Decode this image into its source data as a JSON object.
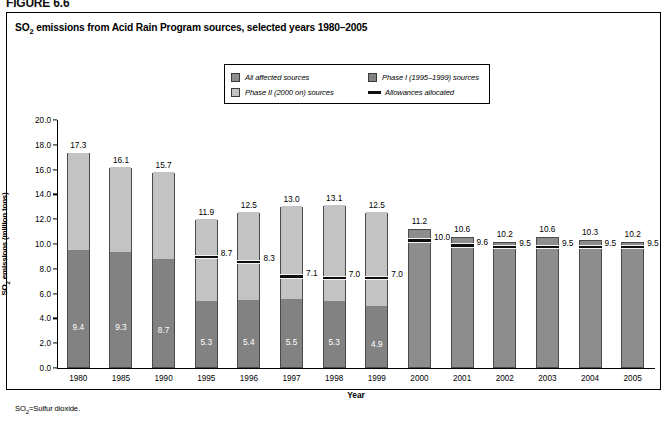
{
  "figure": {
    "label": "FIGURE 6.6"
  },
  "chart_title_prefix": "SO",
  "chart_title_sub": "2",
  "chart_title_rest": " emissions from Acid Rain Program sources, selected years 1980–2005",
  "footnote_prefix": "SO",
  "footnote_sub": "2",
  "footnote_rest": "=Sulfur dioxide.",
  "legend": {
    "items": [
      {
        "label": "All affected sources",
        "swatch": "medium-gray-swatch",
        "color": "#8d8d8d"
      },
      {
        "label": "Phase I (1995–1999) sources",
        "swatch": "dark-gray-swatch",
        "color": "#828282"
      },
      {
        "label": "Phase II (2000 on) sources",
        "swatch": "light-gray-swatch",
        "color": "#c3c3c3"
      },
      {
        "label": "Allowances allocated",
        "swatch": "black-line-swatch",
        "color": "#0d0d0d"
      }
    ]
  },
  "chart_data": {
    "type": "bar",
    "title": "SO2 emissions from Acid Rain Program sources, selected years 1980–2005",
    "xlabel": "Year",
    "ylabel": "SO2 emissions (million tons)",
    "ylim": [
      0,
      20
    ],
    "yticks": [
      "0.0",
      "2.0",
      "4.0",
      "6.0",
      "8.0",
      "10.0",
      "12.0",
      "14.0",
      "16.0",
      "18.0",
      "20.0"
    ],
    "grid": false,
    "legend_position": "top-center",
    "stacked": true,
    "categories": [
      "1980",
      "1985",
      "1990",
      "1995",
      "1996",
      "1997",
      "1998",
      "1999",
      "2000",
      "2001",
      "2002",
      "2003",
      "2004",
      "2005"
    ],
    "series": [
      {
        "name": "Phase I (1995–1999) sources",
        "values": [
          9.4,
          9.3,
          8.7,
          5.3,
          5.4,
          5.5,
          5.3,
          4.9,
          null,
          null,
          null,
          null,
          null,
          null
        ]
      },
      {
        "name": "Phase II (2000 on) sources",
        "values": [
          7.9,
          6.8,
          7.0,
          6.6,
          7.1,
          7.5,
          7.8,
          7.6,
          null,
          null,
          null,
          null,
          null,
          null
        ]
      },
      {
        "name": "All affected sources",
        "values": [
          17.3,
          16.1,
          15.7,
          11.9,
          12.5,
          13.0,
          13.1,
          12.5,
          11.2,
          10.6,
          10.2,
          10.6,
          10.3,
          10.2
        ]
      },
      {
        "name": "Allowances allocated",
        "values": [
          null,
          null,
          null,
          8.7,
          8.3,
          7.1,
          7.0,
          7.0,
          10.0,
          9.6,
          9.5,
          9.5,
          9.5,
          9.5
        ]
      }
    ],
    "bars": [
      {
        "year": "1980",
        "total": 17.3,
        "total_label": "17.3",
        "phase1": 9.4,
        "phase1_label": "9.4",
        "allowance": null,
        "allowance_label": "",
        "single": false
      },
      {
        "year": "1985",
        "total": 16.1,
        "total_label": "16.1",
        "phase1": 9.3,
        "phase1_label": "9.3",
        "allowance": null,
        "allowance_label": "",
        "single": false
      },
      {
        "year": "1990",
        "total": 15.7,
        "total_label": "15.7",
        "phase1": 8.7,
        "phase1_label": "8.7",
        "allowance": null,
        "allowance_label": "",
        "single": false
      },
      {
        "year": "1995",
        "total": 11.9,
        "total_label": "11.9",
        "phase1": 5.3,
        "phase1_label": "5.3",
        "allowance": 8.7,
        "allowance_label": "8.7",
        "single": false
      },
      {
        "year": "1996",
        "total": 12.5,
        "total_label": "12.5",
        "phase1": 5.4,
        "phase1_label": "5.4",
        "allowance": 8.3,
        "allowance_label": "8.3",
        "single": false
      },
      {
        "year": "1997",
        "total": 13.0,
        "total_label": "13.0",
        "phase1": 5.5,
        "phase1_label": "5.5",
        "allowance": 7.1,
        "allowance_label": "7.1",
        "single": false
      },
      {
        "year": "1998",
        "total": 13.1,
        "total_label": "13.1",
        "phase1": 5.3,
        "phase1_label": "5.3",
        "allowance": 7.0,
        "allowance_label": "7.0",
        "single": false
      },
      {
        "year": "1999",
        "total": 12.5,
        "total_label": "12.5",
        "phase1": 4.9,
        "phase1_label": "4.9",
        "allowance": 7.0,
        "allowance_label": "7.0",
        "single": false
      },
      {
        "year": "2000",
        "total": 11.2,
        "total_label": "11.2",
        "phase1": null,
        "phase1_label": "",
        "allowance": 10.0,
        "allowance_label": "10.0",
        "single": true
      },
      {
        "year": "2001",
        "total": 10.6,
        "total_label": "10.6",
        "phase1": null,
        "phase1_label": "",
        "allowance": 9.6,
        "allowance_label": "9.6",
        "single": true
      },
      {
        "year": "2002",
        "total": 10.2,
        "total_label": "10.2",
        "phase1": null,
        "phase1_label": "",
        "allowance": 9.5,
        "allowance_label": "9.5",
        "single": true
      },
      {
        "year": "2003",
        "total": 10.6,
        "total_label": "10.6",
        "phase1": null,
        "phase1_label": "",
        "allowance": 9.5,
        "allowance_label": "9.5",
        "single": true
      },
      {
        "year": "2004",
        "total": 10.3,
        "total_label": "10.3",
        "phase1": null,
        "phase1_label": "",
        "allowance": 9.5,
        "allowance_label": "9.5",
        "single": true
      },
      {
        "year": "2005",
        "total": 10.2,
        "total_label": "10.2",
        "phase1": null,
        "phase1_label": "",
        "allowance": 9.5,
        "allowance_label": "9.5",
        "single": true
      }
    ]
  }
}
